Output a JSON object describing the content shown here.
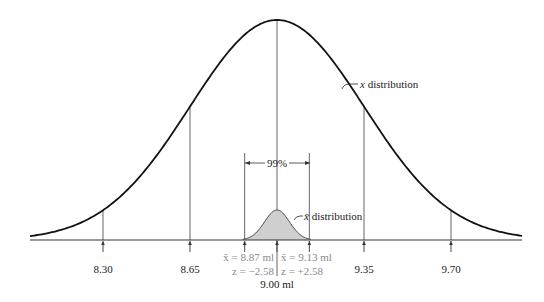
{
  "chart_data": {
    "type": "diagram",
    "title": "",
    "population": {
      "label_var": "x",
      "label_text": " distribution",
      "mean": 9.0,
      "sd": 0.35
    },
    "sampling": {
      "label_var": "x̄",
      "label_text": " distribution",
      "mean": 9.0,
      "sd": 0.05,
      "confidence_label": "99%"
    },
    "ticks": [
      {
        "value": 8.3,
        "label": "8.30"
      },
      {
        "value": 8.65,
        "label": "8.65"
      },
      {
        "value": 9.35,
        "label": "9.35"
      },
      {
        "value": 9.7,
        "label": "9.70"
      }
    ],
    "center_label": "9.00 ml",
    "ci_lower": {
      "value": 8.87,
      "line1": "x̄ = 8.87 ml",
      "line2": "z = −2.58"
    },
    "ci_upper": {
      "value": 9.13,
      "line1": "x̄ = 9.13 ml",
      "line2": "z = +2.58"
    },
    "xlim": [
      7.97,
      10.04
    ],
    "colors": {
      "curve": "#111111",
      "shade": "#cfcfcf",
      "gray": "#8a8a8a",
      "line": "#555555"
    }
  }
}
